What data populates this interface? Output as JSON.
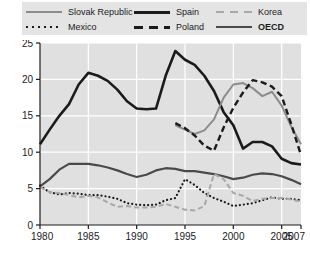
{
  "legend": {
    "rows": [
      [
        {
          "key": "slovak",
          "label": "Slovak Republic",
          "style": "solid-gray",
          "color": "#8c8c8c",
          "bold": false
        },
        {
          "key": "spain",
          "label": "Spain",
          "style": "solid-black",
          "color": "#1b1b1b",
          "bold": false
        },
        {
          "key": "korea",
          "label": "Korea",
          "style": "dashed-gray",
          "color": "#a8a8a8",
          "bold": false
        }
      ],
      [
        {
          "key": "mexico",
          "label": "Mexico",
          "style": "dotted-black",
          "color": "#1b1b1b",
          "bold": false
        },
        {
          "key": "poland",
          "label": "Poland",
          "style": "dashed-black",
          "color": "#1b1b1b",
          "bold": false
        },
        {
          "key": "oecd",
          "label": "OECD",
          "style": "solid-dark",
          "color": "#4a4a4a",
          "bold": true
        }
      ]
    ]
  },
  "axes": {
    "y_ticks": [
      "0",
      "5",
      "10",
      "15",
      "20",
      "25"
    ],
    "x_ticks": [
      "1980",
      "1985",
      "1990",
      "1995",
      "2000",
      "2005",
      "2007"
    ]
  },
  "chart_data": {
    "type": "line",
    "title": "",
    "xlabel": "",
    "ylabel": "",
    "xlim": [
      1980,
      2007
    ],
    "ylim": [
      0,
      25
    ],
    "y_ticks": [
      0,
      5,
      10,
      15,
      20,
      25
    ],
    "x_ticks": [
      1980,
      1985,
      1990,
      1995,
      2000,
      2005,
      2007
    ],
    "grid": "horizontal-and-vertical-white",
    "legend_position": "top",
    "plot_background": "#e0e0e0",
    "series": [
      {
        "name": "Spain",
        "color": "#1b1b1b",
        "style": "solid",
        "width": 2.6,
        "x": [
          1980,
          1981,
          1982,
          1983,
          1984,
          1985,
          1986,
          1987,
          1988,
          1989,
          1990,
          1991,
          1992,
          1993,
          1994,
          1995,
          1996,
          1997,
          1998,
          1999,
          2000,
          2001,
          2002,
          2003,
          2004,
          2005,
          2006,
          2007
        ],
        "y": [
          11.1,
          13.1,
          15.0,
          16.6,
          19.3,
          20.9,
          20.5,
          19.8,
          18.6,
          17.0,
          16.0,
          15.9,
          16.0,
          20.5,
          23.9,
          22.7,
          22.0,
          20.5,
          18.4,
          15.5,
          13.7,
          10.5,
          11.4,
          11.4,
          10.8,
          9.1,
          8.5,
          8.3
        ]
      },
      {
        "name": "Slovak Republic",
        "color": "#8c8c8c",
        "style": "solid",
        "width": 2.0,
        "x": [
          1994,
          1995,
          1996,
          1997,
          1998,
          1999,
          2000,
          2001,
          2002,
          2003,
          2004,
          2005,
          2006,
          2007
        ],
        "y": [
          13.7,
          13.1,
          12.5,
          13.0,
          14.5,
          17.5,
          19.3,
          19.5,
          18.8,
          17.7,
          18.3,
          16.4,
          13.5,
          11.1
        ]
      },
      {
        "name": "Poland",
        "color": "#1b1b1b",
        "style": "dashed",
        "width": 2.4,
        "x": [
          1994,
          1995,
          1996,
          1997,
          1998,
          1999,
          2000,
          2001,
          2002,
          2003,
          2004,
          2005,
          2006,
          2007
        ],
        "y": [
          14.0,
          13.3,
          12.3,
          10.9,
          10.2,
          13.4,
          16.1,
          18.2,
          19.9,
          19.6,
          19.0,
          17.7,
          13.8,
          9.6
        ]
      },
      {
        "name": "OECD",
        "color": "#4a4a4a",
        "style": "solid",
        "width": 2.2,
        "x": [
          1980,
          1981,
          1982,
          1983,
          1984,
          1985,
          1986,
          1987,
          1988,
          1989,
          1990,
          1991,
          1992,
          1993,
          1994,
          1995,
          1996,
          1997,
          1998,
          1999,
          2000,
          2001,
          2002,
          2003,
          2004,
          2005,
          2006,
          2007
        ],
        "y": [
          5.3,
          6.3,
          7.6,
          8.4,
          8.4,
          8.4,
          8.2,
          7.9,
          7.5,
          7.0,
          6.6,
          6.9,
          7.5,
          7.8,
          7.7,
          7.4,
          7.4,
          7.2,
          7.0,
          6.7,
          6.3,
          6.5,
          6.9,
          7.1,
          7.0,
          6.7,
          6.2,
          5.6
        ]
      },
      {
        "name": "Mexico",
        "color": "#1b1b1b",
        "style": "dotted",
        "width": 2.2,
        "x": [
          1980,
          1981,
          1982,
          1983,
          1984,
          1985,
          1986,
          1987,
          1988,
          1989,
          1990,
          1991,
          1992,
          1993,
          1994,
          1995,
          1996,
          1997,
          1998,
          1999,
          2000,
          2001,
          2002,
          2003,
          2004,
          2005,
          2006,
          2007
        ],
        "y": [
          5.4,
          4.5,
          4.2,
          4.4,
          4.3,
          4.1,
          4.1,
          3.9,
          3.6,
          3.0,
          2.8,
          2.7,
          2.8,
          3.4,
          3.7,
          6.3,
          5.5,
          4.4,
          3.7,
          3.2,
          2.6,
          2.8,
          3.0,
          3.4,
          3.8,
          3.6,
          3.6,
          3.4
        ]
      },
      {
        "name": "Korea",
        "color": "#a8a8a8",
        "style": "dashed",
        "width": 2.0,
        "x": [
          1980,
          1981,
          1982,
          1983,
          1984,
          1985,
          1986,
          1987,
          1988,
          1989,
          1990,
          1991,
          1992,
          1993,
          1994,
          1995,
          1996,
          1997,
          1998,
          1999,
          2000,
          2001,
          2002,
          2003,
          2004,
          2005,
          2006,
          2007
        ],
        "y": [
          5.2,
          4.5,
          4.4,
          4.1,
          3.8,
          4.0,
          3.8,
          3.1,
          2.5,
          2.6,
          2.4,
          2.4,
          2.5,
          2.9,
          2.5,
          2.1,
          2.0,
          2.6,
          7.0,
          6.3,
          4.4,
          4.0,
          3.3,
          3.6,
          3.7,
          3.7,
          3.5,
          3.2
        ]
      }
    ]
  }
}
